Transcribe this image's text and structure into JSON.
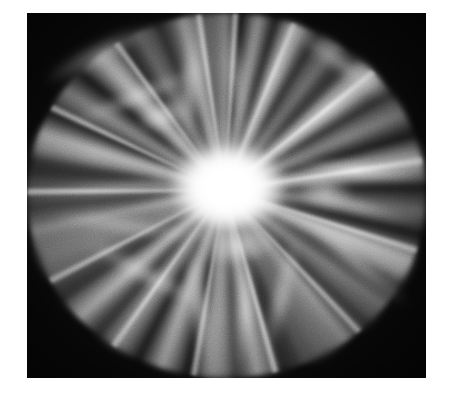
{
  "canvas": {
    "width": 452,
    "height": 404,
    "background_color": "#ffffff",
    "margin_left": 27,
    "margin_top": 13,
    "margin_right": 26,
    "margin_bottom": 26
  },
  "image": {
    "title": "Radial light burst",
    "alt_text": "Grayscale photograph of an intense radial zoom-burst of light with a blown-out white core and streaking rays fading into near-black corners",
    "subject": "explosion-of-light",
    "color_mode": "grayscale",
    "frame": {
      "x": 27,
      "y": 13,
      "width": 399,
      "height": 365
    },
    "core": {
      "center_x_pct": 49.6,
      "center_y_pct": 48.5,
      "core_color": "#ffffff",
      "core_radius_px": 62
    },
    "palette": {
      "highlight": "#ffffff",
      "midtone": "#9a9a9a",
      "shadow": "#2b2b2b",
      "corner_black": "#0b0b0b",
      "page_white": "#ffffff"
    },
    "ray_count": 48,
    "grain_opacity": 0.3
  },
  "streaks": [
    {
      "name": "streak-upper-left",
      "left": 10,
      "top": 28,
      "width": 120,
      "height": 26,
      "rotate": -28,
      "opacity": 0.55
    },
    {
      "name": "streak-upper-left-2",
      "left": 34,
      "top": 74,
      "width": 150,
      "height": 20,
      "rotate": -22,
      "opacity": 0.5
    },
    {
      "name": "streak-top",
      "left": 150,
      "top": 18,
      "width": 26,
      "height": 120,
      "rotate": 6,
      "opacity": 0.6
    },
    {
      "name": "streak-top-2",
      "left": 198,
      "top": 10,
      "width": 22,
      "height": 110,
      "rotate": -4,
      "opacity": 0.52
    },
    {
      "name": "streak-upper-right",
      "left": 250,
      "top": 40,
      "width": 130,
      "height": 22,
      "rotate": 36,
      "opacity": 0.58
    },
    {
      "name": "streak-right",
      "left": 255,
      "top": 150,
      "width": 160,
      "height": 16,
      "rotate": 6,
      "opacity": 0.7
    },
    {
      "name": "streak-right-2",
      "left": 250,
      "top": 186,
      "width": 150,
      "height": 14,
      "rotate": 14,
      "opacity": 0.62
    },
    {
      "name": "streak-left",
      "left": 8,
      "top": 168,
      "width": 185,
      "height": 12,
      "rotate": -3,
      "opacity": 0.55
    },
    {
      "name": "streak-left-2",
      "left": 20,
      "top": 204,
      "width": 160,
      "height": 18,
      "rotate": 8,
      "opacity": 0.48
    },
    {
      "name": "streak-lower-left",
      "left": 48,
      "top": 250,
      "width": 140,
      "height": 22,
      "rotate": 28,
      "opacity": 0.52
    },
    {
      "name": "streak-bottom",
      "left": 160,
      "top": 226,
      "width": 24,
      "height": 135,
      "rotate": -8,
      "opacity": 0.66
    },
    {
      "name": "streak-bottom-2",
      "left": 208,
      "top": 232,
      "width": 20,
      "height": 128,
      "rotate": 4,
      "opacity": 0.58
    },
    {
      "name": "streak-bottom-3",
      "left": 244,
      "top": 222,
      "width": 22,
      "height": 120,
      "rotate": 14,
      "opacity": 0.6
    },
    {
      "name": "streak-lower-right",
      "left": 258,
      "top": 238,
      "width": 140,
      "height": 20,
      "rotate": 40,
      "opacity": 0.56
    },
    {
      "name": "hotspot-upper-left",
      "left": 108,
      "top": 88,
      "width": 56,
      "height": 30,
      "rotate": -18,
      "opacity": 0.7
    },
    {
      "name": "hotspot-right",
      "left": 268,
      "top": 162,
      "width": 60,
      "height": 34,
      "rotate": 8,
      "opacity": 0.72
    },
    {
      "name": "hotspot-below-core",
      "left": 178,
      "top": 216,
      "width": 70,
      "height": 36,
      "rotate": -6,
      "opacity": 0.74
    }
  ]
}
